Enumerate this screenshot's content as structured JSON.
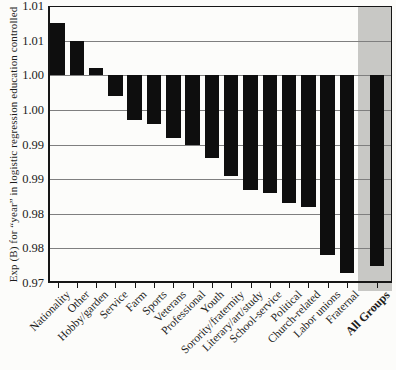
{
  "chart_data": {
    "type": "bar",
    "title": "",
    "xlabel": "",
    "ylabel": "Exp (B) for “year” in logistic regression education controlled",
    "ylim": [
      0.97,
      1.01
    ],
    "ytick_step": 0.005,
    "ytick_values": [
      1.01,
      1.005,
      1.0,
      0.995,
      0.99,
      0.985,
      0.98,
      0.975,
      0.97
    ],
    "ytick_labels": [
      "1.01",
      "1.01",
      "1.00",
      "1.00",
      "0.99",
      "0.99",
      "0.98",
      "0.98",
      "0.97"
    ],
    "baseline": 1.0,
    "grid": true,
    "legend_position": "none",
    "categories": [
      "Nationality",
      "Other",
      "Hobby/garden",
      "Service",
      "Farm",
      "Sports",
      "Veterans",
      "Professional",
      "Youth",
      "Sorority/fraternity",
      "Literary/art/study",
      "School-service",
      "Political",
      "Church-related",
      "Labor unions",
      "Fraternal",
      "All Groups"
    ],
    "values": [
      1.0075,
      1.005,
      1.001,
      0.997,
      0.9935,
      0.993,
      0.991,
      0.99,
      0.988,
      0.9855,
      0.9835,
      0.983,
      0.9815,
      0.981,
      0.974,
      0.9715,
      0.9725
    ],
    "highlight_category": "All Groups",
    "colors": {
      "bar": "#0e0e0e",
      "highlight_band": "#c8c8c5",
      "gridline": "#7f7f7f",
      "axis": "#161616",
      "text": "#1c1c1c"
    }
  }
}
